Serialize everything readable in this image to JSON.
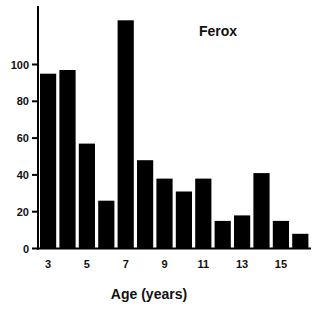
{
  "chart_data": {
    "type": "bar",
    "title": "Ferox",
    "xlabel": "Age (years)",
    "ylabel": "",
    "categories": [
      3,
      4,
      5,
      6,
      7,
      8,
      9,
      10,
      11,
      12,
      13,
      14,
      15,
      16
    ],
    "values": [
      95,
      97,
      57,
      26,
      124,
      48,
      38,
      31,
      38,
      15,
      18,
      41,
      15,
      8
    ],
    "x_tick_labels": [
      "3",
      "5",
      "7",
      "9",
      "11",
      "13",
      "15"
    ],
    "x_tick_categories": [
      3,
      5,
      7,
      9,
      11,
      13,
      15
    ],
    "y_ticks": [
      0,
      20,
      40,
      60,
      80,
      100
    ],
    "y_tick_labels": [
      "0",
      "20",
      "40",
      "60",
      "80",
      "100"
    ],
    "ylim": [
      0,
      132
    ],
    "grid": false,
    "legend": "none",
    "title_position": "top-right",
    "bar_color": "#000000"
  }
}
